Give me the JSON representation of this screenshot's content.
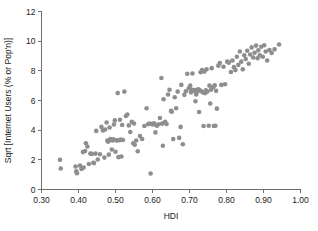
{
  "chart_data": {
    "type": "scatter",
    "title": "",
    "xlabel": "HDI",
    "ylabel": "Sqrt [Internet Users (% or Pop'n)]",
    "xlim": [
      0.3,
      1.0
    ],
    "ylim": [
      0,
      12
    ],
    "xticks": [
      0.3,
      0.4,
      0.5,
      0.6,
      0.7,
      0.8,
      0.9,
      1.0
    ],
    "xtick_labels": [
      "0.30",
      "0.40",
      "0.50",
      "0.60",
      "0.70",
      "0.80",
      "0.90",
      "1.00"
    ],
    "yticks": [
      0,
      2,
      4,
      6,
      8,
      10,
      12
    ],
    "ytick_labels": [
      "0",
      "2",
      "4",
      "6",
      "8",
      "10",
      "12"
    ],
    "grid": false,
    "legend": null,
    "marker_color": "#8e8e8e",
    "marker_size": 2.3,
    "n_points": 160,
    "points": [
      [
        0.35,
        2.0
      ],
      [
        0.352,
        1.42
      ],
      [
        0.392,
        1.55
      ],
      [
        0.394,
        1.22
      ],
      [
        0.396,
        1.1
      ],
      [
        0.404,
        1.62
      ],
      [
        0.408,
        1.38
      ],
      [
        0.412,
        2.52
      ],
      [
        0.414,
        1.48
      ],
      [
        0.418,
        2.6
      ],
      [
        0.42,
        3.12
      ],
      [
        0.424,
        2.9
      ],
      [
        0.428,
        1.72
      ],
      [
        0.432,
        2.42
      ],
      [
        0.436,
        2.4
      ],
      [
        0.44,
        1.8
      ],
      [
        0.442,
        1.78
      ],
      [
        0.446,
        2.42
      ],
      [
        0.448,
        3.95
      ],
      [
        0.452,
        2.02
      ],
      [
        0.458,
        2.38
      ],
      [
        0.462,
        4.22
      ],
      [
        0.466,
        3.98
      ],
      [
        0.47,
        2.15
      ],
      [
        0.472,
        4.05
      ],
      [
        0.476,
        4.52
      ],
      [
        0.478,
        3.3
      ],
      [
        0.48,
        3.22
      ],
      [
        0.482,
        2.35
      ],
      [
        0.484,
        4.18
      ],
      [
        0.486,
        3.4
      ],
      [
        0.488,
        3.34
      ],
      [
        0.49,
        2.7
      ],
      [
        0.492,
        3.3
      ],
      [
        0.494,
        3.38
      ],
      [
        0.496,
        4.38
      ],
      [
        0.498,
        4.66
      ],
      [
        0.5,
        2.55
      ],
      [
        0.502,
        3.32
      ],
      [
        0.504,
        3.3
      ],
      [
        0.506,
        6.5
      ],
      [
        0.508,
        2.18
      ],
      [
        0.51,
        3.32
      ],
      [
        0.512,
        4.7
      ],
      [
        0.514,
        3.36
      ],
      [
        0.516,
        2.22
      ],
      [
        0.518,
        4.35
      ],
      [
        0.52,
        3.34
      ],
      [
        0.524,
        6.6
      ],
      [
        0.528,
        4.95
      ],
      [
        0.532,
        5.05
      ],
      [
        0.536,
        4.32
      ],
      [
        0.54,
        3.88
      ],
      [
        0.544,
        4.56
      ],
      [
        0.548,
        3.12
      ],
      [
        0.55,
        4.45
      ],
      [
        0.552,
        3.02
      ],
      [
        0.556,
        3.3
      ],
      [
        0.56,
        2.58
      ],
      [
        0.566,
        3.6
      ],
      [
        0.572,
        3.4
      ],
      [
        0.578,
        4.28
      ],
      [
        0.584,
        5.48
      ],
      [
        0.588,
        4.4
      ],
      [
        0.592,
        4.45
      ],
      [
        0.595,
        1.08
      ],
      [
        0.598,
        4.42
      ],
      [
        0.602,
        4.38
      ],
      [
        0.604,
        4.46
      ],
      [
        0.608,
        3.85
      ],
      [
        0.612,
        4.3
      ],
      [
        0.616,
        4.4
      ],
      [
        0.62,
        4.82
      ],
      [
        0.624,
        7.52
      ],
      [
        0.626,
        4.44
      ],
      [
        0.628,
        2.95
      ],
      [
        0.63,
        6.08
      ],
      [
        0.634,
        4.56
      ],
      [
        0.638,
        4.42
      ],
      [
        0.642,
        6.4
      ],
      [
        0.646,
        6.72
      ],
      [
        0.65,
        5.3
      ],
      [
        0.652,
        5.25
      ],
      [
        0.656,
        3.4
      ],
      [
        0.66,
        6.22
      ],
      [
        0.664,
        5.48
      ],
      [
        0.668,
        6.6
      ],
      [
        0.672,
        3.48
      ],
      [
        0.676,
        4.22
      ],
      [
        0.678,
        7.05
      ],
      [
        0.682,
        3.05
      ],
      [
        0.686,
        6.38
      ],
      [
        0.69,
        6.62
      ],
      [
        0.694,
        7.8
      ],
      [
        0.698,
        6.82
      ],
      [
        0.702,
        7.0
      ],
      [
        0.704,
        6.55
      ],
      [
        0.706,
        6.72
      ],
      [
        0.708,
        7.82
      ],
      [
        0.712,
        6.65
      ],
      [
        0.714,
        6.7
      ],
      [
        0.716,
        5.95
      ],
      [
        0.718,
        6.4
      ],
      [
        0.72,
        6.58
      ],
      [
        0.722,
        6.72
      ],
      [
        0.724,
        6.75
      ],
      [
        0.726,
        5.22
      ],
      [
        0.728,
        6.68
      ],
      [
        0.73,
        7.9
      ],
      [
        0.732,
        6.62
      ],
      [
        0.734,
        8.05
      ],
      [
        0.736,
        6.55
      ],
      [
        0.738,
        4.28
      ],
      [
        0.74,
        7.95
      ],
      [
        0.742,
        6.5
      ],
      [
        0.744,
        6.68
      ],
      [
        0.746,
        8.1
      ],
      [
        0.748,
        6.6
      ],
      [
        0.752,
        4.3
      ],
      [
        0.754,
        7.0
      ],
      [
        0.756,
        5.8
      ],
      [
        0.758,
        6.72
      ],
      [
        0.76,
        8.18
      ],
      [
        0.764,
        6.9
      ],
      [
        0.766,
        4.28
      ],
      [
        0.768,
        7.02
      ],
      [
        0.77,
        4.3
      ],
      [
        0.772,
        6.65
      ],
      [
        0.774,
        5.45
      ],
      [
        0.778,
        8.35
      ],
      [
        0.782,
        8.52
      ],
      [
        0.786,
        7.05
      ],
      [
        0.792,
        8.28
      ],
      [
        0.796,
        7.1
      ],
      [
        0.802,
        8.62
      ],
      [
        0.806,
        8.55
      ],
      [
        0.812,
        7.92
      ],
      [
        0.816,
        8.7
      ],
      [
        0.82,
        8.25
      ],
      [
        0.824,
        8.05
      ],
      [
        0.828,
        8.95
      ],
      [
        0.832,
        8.4
      ],
      [
        0.836,
        9.3
      ],
      [
        0.84,
        8.62
      ],
      [
        0.844,
        8.1
      ],
      [
        0.848,
        9.05
      ],
      [
        0.852,
        8.8
      ],
      [
        0.856,
        9.35
      ],
      [
        0.86,
        8.48
      ],
      [
        0.864,
        9.1
      ],
      [
        0.868,
        9.58
      ],
      [
        0.872,
        8.9
      ],
      [
        0.876,
        9.22
      ],
      [
        0.88,
        9.7
      ],
      [
        0.884,
        8.85
      ],
      [
        0.886,
        9.38
      ],
      [
        0.89,
        9.05
      ],
      [
        0.894,
        9.62
      ],
      [
        0.898,
        8.95
      ],
      [
        0.902,
        9.72
      ],
      [
        0.906,
        9.3
      ],
      [
        0.91,
        8.7
      ],
      [
        0.916,
        9.4
      ],
      [
        0.922,
        9.2
      ],
      [
        0.93,
        9.45
      ],
      [
        0.942,
        9.78
      ]
    ]
  }
}
